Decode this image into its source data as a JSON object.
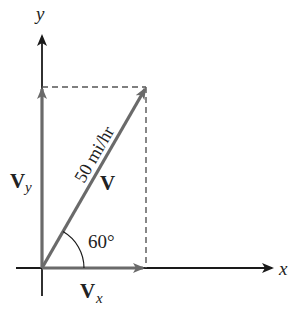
{
  "diagram": {
    "axes": {
      "x_label": "x",
      "y_label": "y"
    },
    "vector": {
      "label": "V",
      "magnitude_label": "50 mi/hr",
      "angle_label": "60°"
    },
    "components": {
      "x": {
        "main": "V",
        "sub": "x"
      },
      "y": {
        "main": "V",
        "sub": "y"
      }
    },
    "colors": {
      "axis": "#1a1a1a",
      "vector": "#6a6a6a",
      "dashed": "#555555",
      "text": "#222222"
    }
  }
}
